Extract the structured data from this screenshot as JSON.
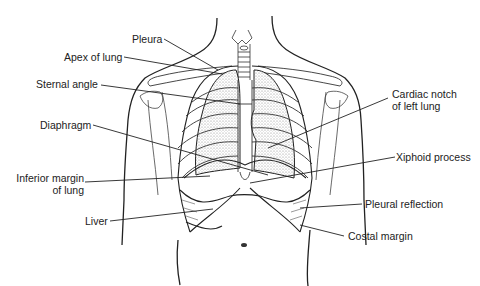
{
  "figure": {
    "colors": {
      "line": "#222222",
      "text": "#222222",
      "hatch": "#777777",
      "background": "#ffffff"
    }
  },
  "labels": {
    "pleura": "Pleura",
    "apex_of_lung": "Apex of lung",
    "sternal_angle": "Sternal angle",
    "diaphragm": "Diaphragm",
    "inferior_margin_line1": "Inferior margin",
    "inferior_margin_line2": "of lung",
    "liver": "Liver",
    "cardiac_notch_line1": "Cardiac notch",
    "cardiac_notch_line2": "of left lung",
    "xiphoid_process": "Xiphoid process",
    "pleural_reflection": "Pleural reflection",
    "costal_margin": "Costal margin"
  }
}
